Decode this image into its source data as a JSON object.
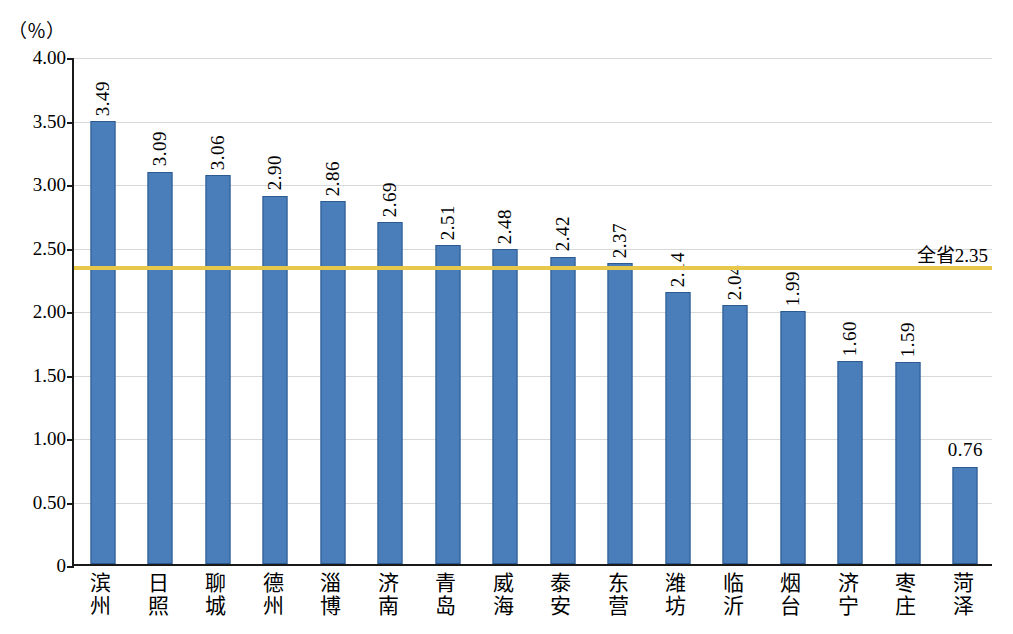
{
  "chart_data": {
    "type": "bar",
    "title": "",
    "subtitle": "",
    "unit_label": "（％）",
    "xlabel": "",
    "ylabel": "",
    "ylim": [
      0,
      4.0
    ],
    "ytick_labels": [
      "0",
      "0.50",
      "1.00",
      "1.50",
      "2.00",
      "2.50",
      "3.00",
      "3.50",
      "4.00"
    ],
    "ytick_values": [
      0,
      0.5,
      1.0,
      1.5,
      2.0,
      2.5,
      3.0,
      3.5,
      4.0
    ],
    "grid": true,
    "legend": "none",
    "bar_color": "#4a7ebb",
    "reference_line_color": "#e8c84a",
    "reference_line": {
      "label": "全省2.35",
      "value": 2.35
    },
    "categories": [
      "滨州",
      "日照",
      "聊城",
      "德州",
      "淄博",
      "济南",
      "青岛",
      "威海",
      "泰安",
      "东营",
      "潍坊",
      "临沂",
      "烟台",
      "济宁",
      "枣庄",
      "菏泽"
    ],
    "values": [
      3.49,
      3.09,
      3.06,
      2.9,
      2.86,
      2.69,
      2.51,
      2.48,
      2.42,
      2.37,
      2.14,
      2.04,
      1.99,
      1.6,
      1.59,
      0.76
    ],
    "value_labels": [
      "3.49",
      "3.09",
      "3.06",
      "2.90",
      "2.86",
      "2.69",
      "2.51",
      "2.48",
      "2.42",
      "2.37",
      "2.14",
      "2.04",
      "1.99",
      "1.60",
      "1.59",
      "0.76"
    ]
  }
}
